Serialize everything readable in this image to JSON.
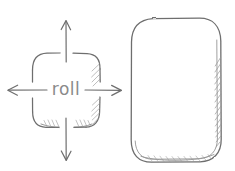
{
  "document": {
    "kind": "hand-drawn-pencil-sketch",
    "title": "roll",
    "background_color": "#ffffff",
    "stroke_color": "#6e6e6e",
    "shading_color": "#9a9a9a",
    "label_color": "#8a8a8a"
  },
  "left_shape": {
    "name": "rounded-square",
    "label": "roll",
    "x": 32,
    "y": 53,
    "width": 68,
    "height": 75,
    "corner_radius": 14,
    "shaded_edges": [
      "right",
      "bottom"
    ]
  },
  "arrows": [
    {
      "direction": "up",
      "label": "",
      "from_x": 66,
      "from_y": 62,
      "to_x": 66,
      "to_y": 21
    },
    {
      "direction": "down",
      "label": "",
      "from_x": 66,
      "from_y": 118,
      "to_x": 66,
      "to_y": 160
    },
    {
      "direction": "left",
      "label": "",
      "from_x": 47,
      "from_y": 90,
      "to_x": 8,
      "to_y": 90
    },
    {
      "direction": "right",
      "label": "",
      "from_x": 85,
      "from_y": 90,
      "to_x": 121,
      "to_y": 90
    }
  ],
  "right_shape": {
    "name": "rounded-rectangle",
    "label": "",
    "x": 131,
    "y": 18,
    "width": 90,
    "height": 144,
    "corner_radius": 22,
    "shaded_edges": [
      "right",
      "bottom"
    ]
  }
}
